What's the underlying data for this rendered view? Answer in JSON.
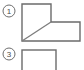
{
  "figure": {
    "background_color": "#ffffff",
    "line_color": "#6b6b6b",
    "marker_color": "#6e6e6e",
    "text_color": "#4a4a4a",
    "markers": [
      {
        "label": "1",
        "name": "step-marker-1",
        "cx": 9,
        "cy": 11,
        "r": 6
      },
      {
        "label": "3",
        "name": "step-marker-3",
        "cx": 9,
        "cy": 54,
        "r": 6
      }
    ],
    "shapes": [
      {
        "name": "l-shaped-outline",
        "type": "polygon",
        "points": "22,4 51,4 51,22 80,22 80,41 22,41"
      },
      {
        "name": "diagonal-line",
        "type": "line",
        "x1": 22,
        "y1": 41,
        "x2": 51,
        "y2": 22
      },
      {
        "name": "partial-rectangle",
        "type": "rect",
        "x": 22,
        "y": 50,
        "width": 34,
        "height": 24
      }
    ]
  }
}
